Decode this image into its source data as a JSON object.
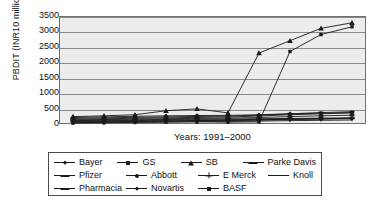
{
  "chart_data": {
    "type": "line",
    "title": "",
    "xlabel": "Years: 1991–2000",
    "ylabel": "PBDIT (INR10 million)",
    "ylim": [
      0,
      3500
    ],
    "yticks": [
      0,
      500,
      1000,
      1500,
      2000,
      2500,
      3000,
      3500
    ],
    "grid": true,
    "legend_position": "below",
    "x": [
      1991,
      1992,
      1993,
      1994,
      1995,
      1996,
      1997,
      1998,
      1999,
      2000
    ],
    "categories": [
      "1991",
      "1992",
      "1993",
      "1994",
      "1995",
      "1996",
      "1997",
      "1998",
      "1999",
      "2000"
    ],
    "series": [
      {
        "name": "Bayer",
        "marker": "diamond",
        "values": [
          210,
          230,
          250,
          265,
          275,
          280,
          300,
          330,
          350,
          370
        ]
      },
      {
        "name": "GS",
        "marker": "square",
        "values": [
          150,
          170,
          185,
          200,
          215,
          225,
          260,
          300,
          330,
          360
        ]
      },
      {
        "name": "SB",
        "marker": "triangle",
        "values": [
          240,
          265,
          300,
          430,
          490,
          360,
          2300,
          2700,
          3100,
          3280
        ]
      },
      {
        "name": "Parke Davis",
        "marker": "dash",
        "values": [
          110,
          125,
          135,
          145,
          155,
          160,
          170,
          180,
          190,
          200
        ]
      },
      {
        "name": "Pfizer",
        "marker": "dash",
        "values": [
          180,
          200,
          215,
          230,
          245,
          255,
          285,
          330,
          370,
          400
        ]
      },
      {
        "name": "Abbott",
        "marker": "circle",
        "values": [
          95,
          105,
          115,
          125,
          130,
          138,
          150,
          165,
          175,
          185
        ]
      },
      {
        "name": "E Merck",
        "marker": "plus",
        "values": [
          60,
          70,
          80,
          90,
          100,
          110,
          125,
          145,
          160,
          175
        ]
      },
      {
        "name": "Knoll",
        "marker": "none",
        "values": [
          45,
          55,
          62,
          70,
          78,
          85,
          95,
          110,
          120,
          130
        ]
      },
      {
        "name": "Pharmacia",
        "marker": "dash",
        "values": [
          130,
          145,
          158,
          170,
          182,
          190,
          210,
          240,
          265,
          285
        ]
      },
      {
        "name": "Novartis",
        "marker": "diamond",
        "values": [
          75,
          85,
          95,
          105,
          112,
          120,
          135,
          155,
          170,
          185
        ]
      },
      {
        "name": "BASF",
        "marker": "square",
        "values": [
          30,
          40,
          50,
          60,
          70,
          60,
          70,
          2350,
          2900,
          3150
        ]
      }
    ]
  },
  "axis": {
    "y_title": "PBDIT (INR10 million)",
    "x_caption": "Years: 1991–2000",
    "y_tick_labels": [
      "3500",
      "3000",
      "2500",
      "2000",
      "1500",
      "1000",
      "500",
      "0"
    ]
  },
  "legend": {
    "rows": [
      [
        {
          "label": "Bayer",
          "marker": "diamond"
        },
        {
          "label": "GS",
          "marker": "square"
        },
        {
          "label": "SB",
          "marker": "triangle"
        },
        {
          "label": "Parke Davis",
          "marker": "dash"
        }
      ],
      [
        {
          "label": "Pfizer",
          "marker": "dash"
        },
        {
          "label": "Abbott",
          "marker": "circle"
        },
        {
          "label": "E Merck",
          "marker": "plus"
        },
        {
          "label": "Knoll",
          "marker": "none"
        }
      ],
      [
        {
          "label": "Pharmacia",
          "marker": "dash"
        },
        {
          "label": "Novartis",
          "marker": "diamond"
        },
        {
          "label": "BASF",
          "marker": "square"
        }
      ]
    ]
  },
  "colors": {
    "line": "#1a1a1a",
    "plot_background": "#ececec",
    "gridline": "#8a8a8a",
    "frame": "#6f6f6f",
    "page_background": "#ffffff"
  }
}
